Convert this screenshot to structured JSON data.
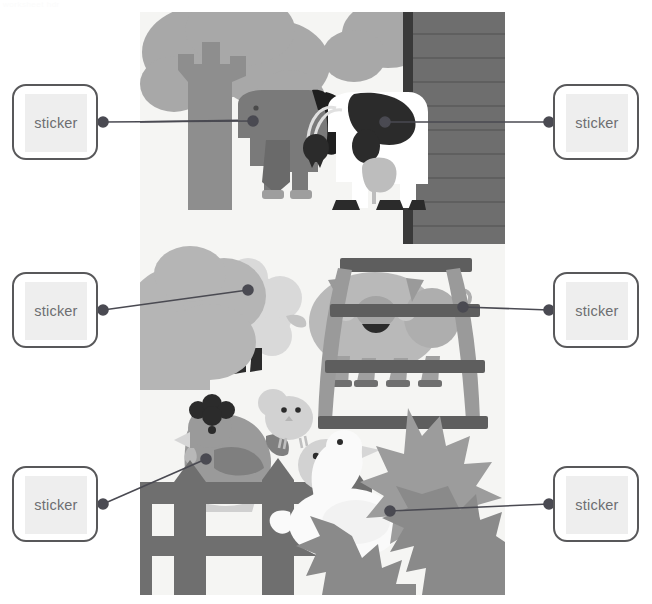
{
  "page": {
    "header_note": "worksheet hdr",
    "background_color": "#ffffff",
    "width": 652,
    "height": 604
  },
  "illustration": {
    "name": "farm-animals-scene",
    "background_color": "#f5f5f3",
    "x": 140,
    "y": 12,
    "width": 365,
    "height": 583,
    "palette": {
      "tree_foliage": "#a8a8a8",
      "tree_trunk": "#8e8e8e",
      "bush_light": "#b5b5b5",
      "bush_mid": "#9c9c9c",
      "bush_dark": "#8a8a8a",
      "barn_wall": "#6e6e6e",
      "barn_trim": "#3a3a3a",
      "fence": "#6f6f6f",
      "gate": "#8c8c8c",
      "gate_rail": "#5e5e5e",
      "horse_body": "#7a7a7a",
      "horse_mane": "#1f1f1f",
      "cow_body": "#ffffff",
      "cow_spot": "#2b2b2b",
      "cow_udder": "#bdbdbd",
      "sheep_wool": "#d9d9d9",
      "pig_body": "#b9b9b9",
      "hen_body": "#9a9a9a",
      "hen_comb": "#2b2b2b",
      "chick_body": "#d2d2d2",
      "goose_body": "#fafafa"
    },
    "objects": [
      {
        "name": "tree",
        "label": "tree"
      },
      {
        "name": "horse",
        "label": "horse"
      },
      {
        "name": "cow",
        "label": "cow"
      },
      {
        "name": "barn-wall",
        "label": "barn wall"
      },
      {
        "name": "sheep",
        "label": "sheep"
      },
      {
        "name": "bush-large",
        "label": "bush"
      },
      {
        "name": "pig",
        "label": "pig"
      },
      {
        "name": "gate",
        "label": "gate"
      },
      {
        "name": "hen",
        "label": "hen"
      },
      {
        "name": "fence",
        "label": "fence"
      },
      {
        "name": "chick-upper",
        "label": "chick"
      },
      {
        "name": "chick-lower",
        "label": "chick"
      },
      {
        "name": "goose",
        "label": "goose"
      },
      {
        "name": "bush-leaves",
        "label": "leafy bush"
      }
    ]
  },
  "stickers": {
    "label": "sticker",
    "border_color": "#58585a",
    "inner_color": "#eeeeee",
    "text_color": "#6d6e71",
    "slots": [
      {
        "id": "sticker-top-left",
        "side": "left",
        "label": "sticker",
        "x": 12,
        "y": 84,
        "dot_x": 103,
        "dot_y": 122,
        "target_x": 253,
        "target_y": 121
      },
      {
        "id": "sticker-top-right",
        "side": "right",
        "label": "sticker",
        "x": 553,
        "y": 84,
        "dot_x": 549,
        "dot_y": 122,
        "target_x": 385,
        "target_y": 122
      },
      {
        "id": "sticker-mid-left",
        "side": "left",
        "label": "sticker",
        "x": 12,
        "y": 272,
        "dot_x": 103,
        "dot_y": 310,
        "target_x": 248,
        "target_y": 290
      },
      {
        "id": "sticker-mid-right",
        "side": "right",
        "label": "sticker",
        "x": 553,
        "y": 272,
        "dot_x": 549,
        "dot_y": 310,
        "target_x": 463,
        "target_y": 307
      },
      {
        "id": "sticker-bottom-left",
        "side": "left",
        "label": "sticker",
        "x": 12,
        "y": 466,
        "dot_x": 103,
        "dot_y": 504,
        "target_x": 206,
        "target_y": 459
      },
      {
        "id": "sticker-bottom-right",
        "side": "right",
        "label": "sticker",
        "x": 553,
        "y": 466,
        "dot_x": 549,
        "dot_y": 504,
        "target_x": 390,
        "target_y": 511
      }
    ],
    "connector_color": "#4a4a52",
    "connector_width": 1.6,
    "dot_radius": 5
  }
}
